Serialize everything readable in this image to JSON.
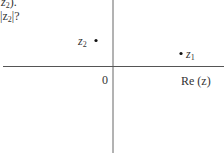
{
  "question_fragment": {
    "line1": "z",
    "line1_sub": "2",
    "line1_tail": ").",
    "line2_pre": "|z",
    "line2_sub": "2",
    "line2_tail": "|?"
  },
  "axes": {
    "origin_label": "0",
    "real_axis_label": "Re (z)"
  },
  "points": [
    {
      "name": "z",
      "sub": "1",
      "quadrant": "fourth-near-axis",
      "label_side": "right"
    },
    {
      "name": "z",
      "sub": "2",
      "quadrant": "second",
      "label_side": "left"
    }
  ],
  "colors": {
    "axis": "#555555",
    "text": "#333333",
    "point": "#111111"
  }
}
